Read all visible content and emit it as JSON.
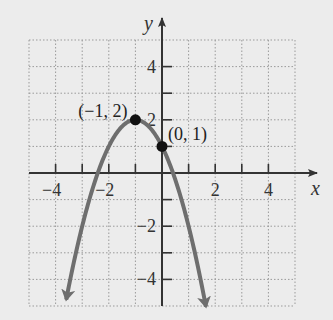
{
  "chart_data": {
    "type": "line",
    "title": "",
    "xlabel": "x",
    "ylabel": "y",
    "xlim": [
      -5,
      5
    ],
    "ylim": [
      -5,
      5
    ],
    "grid": true,
    "grid_style": "dotted",
    "x_ticks": [
      -4,
      -3,
      -2,
      -1,
      1,
      2,
      3,
      4
    ],
    "x_tick_labels": [
      "−4",
      "−2",
      "2",
      "4"
    ],
    "x_tick_label_values": [
      -4,
      -2,
      2,
      4
    ],
    "y_ticks": [
      -4,
      -3,
      -2,
      -1,
      1,
      2,
      3,
      4
    ],
    "y_tick_labels": [
      "4",
      "2",
      "−2",
      "−4"
    ],
    "y_tick_label_values": [
      4,
      2,
      -2,
      -4
    ],
    "series": [
      {
        "name": "parabola",
        "equation": "y = -(x+1)^2 + 2",
        "x_range": [
          -3.6,
          1.65
        ],
        "color": "#6e6e6e",
        "arrows_at_ends": true
      }
    ],
    "points": [
      {
        "x": -1,
        "y": 2,
        "label": "(−1, 2)"
      },
      {
        "x": 0,
        "y": 1,
        "label": "(0, 1)"
      }
    ]
  },
  "colors": {
    "background": "#ececec",
    "axis": "#333333",
    "grid": "#9a9a9a",
    "curve": "#6e6e6e",
    "point": "#111111"
  }
}
